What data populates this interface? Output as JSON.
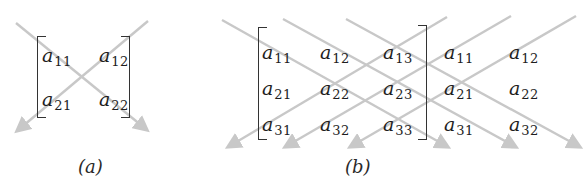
{
  "diagram_a": {
    "caption": "(a)",
    "caption_pos": [
      78,
      158
    ],
    "brackets": {
      "left": {
        "x": 37,
        "y": 36,
        "w": 9,
        "h": 82
      },
      "right": {
        "x": 121,
        "y": 36,
        "w": 9,
        "h": 82
      }
    },
    "elements": [
      {
        "base": "a",
        "sub": "11",
        "x": 42,
        "y": 46
      },
      {
        "base": "a",
        "sub": "12",
        "x": 99,
        "y": 46
      },
      {
        "base": "a",
        "sub": "21",
        "x": 42,
        "y": 90
      },
      {
        "base": "a",
        "sub": "22",
        "x": 99,
        "y": 90
      }
    ],
    "arrows": [
      {
        "direction": "down-right",
        "x1": 16,
        "y1": 23,
        "x2": 147,
        "y2": 130
      },
      {
        "direction": "down-left",
        "x1": 148,
        "y1": 21,
        "x2": 17,
        "y2": 131
      }
    ]
  },
  "diagram_b": {
    "caption": "(b)",
    "caption_pos": [
      345,
      158
    ],
    "brackets": {
      "left": {
        "x": 258,
        "y": 27,
        "w": 9,
        "h": 113
      },
      "right": {
        "x": 418,
        "y": 25,
        "w": 9,
        "h": 115
      }
    },
    "elements": [
      {
        "base": "a",
        "sub": "11",
        "x": 262,
        "y": 43
      },
      {
        "base": "a",
        "sub": "12",
        "x": 320,
        "y": 43
      },
      {
        "base": "a",
        "sub": "13",
        "x": 383,
        "y": 43
      },
      {
        "base": "a",
        "sub": "11",
        "x": 444,
        "y": 43
      },
      {
        "base": "a",
        "sub": "12",
        "x": 509,
        "y": 43
      },
      {
        "base": "a",
        "sub": "21",
        "x": 262,
        "y": 79
      },
      {
        "base": "a",
        "sub": "22",
        "x": 320,
        "y": 79
      },
      {
        "base": "a",
        "sub": "23",
        "x": 383,
        "y": 79
      },
      {
        "base": "a",
        "sub": "21",
        "x": 444,
        "y": 79
      },
      {
        "base": "a",
        "sub": "22",
        "x": 509,
        "y": 79
      },
      {
        "base": "a",
        "sub": "31",
        "x": 262,
        "y": 115
      },
      {
        "base": "a",
        "sub": "32",
        "x": 320,
        "y": 115
      },
      {
        "base": "a",
        "sub": "33",
        "x": 383,
        "y": 115
      },
      {
        "base": "a",
        "sub": "31",
        "x": 444,
        "y": 115
      },
      {
        "base": "a",
        "sub": "32",
        "x": 509,
        "y": 115
      }
    ],
    "arrows": [
      {
        "direction": "down-right",
        "x1": 222,
        "y1": 20,
        "x2": 448,
        "y2": 147
      },
      {
        "direction": "down-right",
        "x1": 283,
        "y1": 19,
        "x2": 516,
        "y2": 147
      },
      {
        "direction": "down-right",
        "x1": 346,
        "y1": 19,
        "x2": 580,
        "y2": 147
      },
      {
        "direction": "down-left",
        "x1": 447,
        "y1": 17,
        "x2": 228,
        "y2": 147
      },
      {
        "direction": "down-left",
        "x1": 511,
        "y1": 16,
        "x2": 285,
        "y2": 147
      },
      {
        "direction": "down-left",
        "x1": 576,
        "y1": 16,
        "x2": 350,
        "y2": 147
      }
    ]
  },
  "colors": {
    "arrow": "#c8c8c8",
    "text": "#1e1e1e",
    "bracket": "#333333",
    "background": "#ffffff"
  }
}
